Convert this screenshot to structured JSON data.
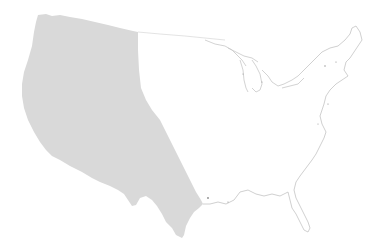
{
  "map": {
    "subject": "contiguous-united-states",
    "highlighted_region": "western-states",
    "colors": {
      "background": "#ffffff",
      "highlight_fill": "#d9d9d9",
      "outline": "#c8c8c8",
      "outline_dark": "#9a9a9a"
    }
  }
}
